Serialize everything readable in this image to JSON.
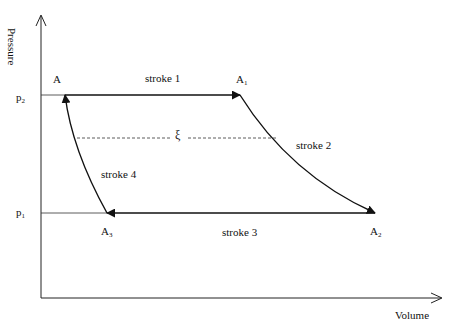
{
  "diagram": {
    "type": "pressure-volume cycle",
    "axes": {
      "y_label": "Pressure",
      "x_label": "Volume",
      "pressure_ticks": [
        {
          "base": "p",
          "sub": "2"
        },
        {
          "base": "p",
          "sub": "1"
        }
      ]
    },
    "points": [
      {
        "id": "A",
        "base": "A",
        "sub": ""
      },
      {
        "id": "A1",
        "base": "A",
        "sub": "1"
      },
      {
        "id": "A2",
        "base": "A",
        "sub": "2"
      },
      {
        "id": "A3",
        "base": "A",
        "sub": "3"
      }
    ],
    "strokes": [
      {
        "label": "stroke 1",
        "from": "A",
        "to": "A1",
        "shape": "horizontal line at p2"
      },
      {
        "label": "stroke 2",
        "from": "A1",
        "to": "A2",
        "shape": "curve"
      },
      {
        "label": "stroke 3",
        "from": "A2",
        "to": "A3",
        "shape": "horizontal line at p1"
      },
      {
        "label": "stroke 4",
        "from": "A3",
        "to": "A",
        "shape": "curve"
      }
    ],
    "dashed_line_label": "ξ"
  }
}
